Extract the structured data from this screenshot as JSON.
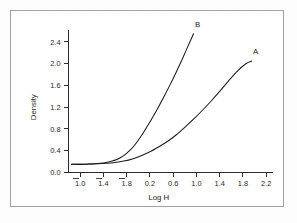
{
  "figure": {
    "background_color": "#ffffff",
    "frame_color": "#9aa3ad",
    "axis_color": "#2c2c2c",
    "curve_color": "#1b1b1b"
  },
  "chart_data": {
    "type": "line",
    "title": "",
    "subtitle": "",
    "xlabel": "Log H",
    "ylabel": "Density",
    "xlim": [
      -1.2,
      2.3
    ],
    "ylim": [
      0.0,
      2.62
    ],
    "grid": false,
    "legend_position": "inline-curve-labels",
    "xticks": [
      -1.0,
      -1.4,
      -1.8,
      0.2,
      0.6,
      1.0,
      1.4,
      1.8,
      2.2
    ],
    "xtick_labels": [
      "1.0",
      "1.4",
      "1.8",
      "0.2",
      "0.6",
      "1.0",
      "1.4",
      "1.8",
      "2.2"
    ],
    "xtick_overbar": [
      true,
      true,
      true,
      false,
      false,
      false,
      false,
      false,
      false
    ],
    "xtick_positions": [
      -1.0,
      -0.6,
      -0.2,
      0.2,
      0.6,
      1.0,
      1.4,
      1.8,
      2.2
    ],
    "yticks": [
      0.0,
      0.4,
      0.8,
      1.2,
      1.6,
      2.0,
      2.4
    ],
    "ytick_labels": [
      "0.0",
      "0.4",
      "0.8",
      "1.2",
      "1.6",
      "2.0",
      "2.4"
    ],
    "annotations": [
      {
        "text": "A",
        "x": 2.02,
        "y": 2.18
      },
      {
        "text": "B",
        "x": 1.02,
        "y": 2.68
      }
    ],
    "series": [
      {
        "name": "B",
        "label": "B",
        "x": [
          -1.15,
          -1.05,
          -0.95,
          -0.85,
          -0.75,
          -0.65,
          -0.55,
          -0.45,
          -0.35,
          -0.25,
          -0.15,
          -0.05,
          0.05,
          0.15,
          0.25,
          0.35,
          0.45,
          0.55,
          0.65,
          0.75,
          0.85,
          0.95
        ],
        "y": [
          0.15,
          0.15,
          0.15,
          0.155,
          0.16,
          0.17,
          0.185,
          0.21,
          0.25,
          0.31,
          0.4,
          0.52,
          0.67,
          0.84,
          1.02,
          1.21,
          1.41,
          1.62,
          1.84,
          2.07,
          2.31,
          2.55
        ]
      },
      {
        "name": "A",
        "label": "A",
        "x": [
          -1.15,
          -1.0,
          -0.85,
          -0.7,
          -0.55,
          -0.4,
          -0.25,
          -0.1,
          0.05,
          0.2,
          0.35,
          0.5,
          0.65,
          0.8,
          0.95,
          1.1,
          1.25,
          1.4,
          1.55,
          1.7,
          1.85,
          1.95
        ],
        "y": [
          0.15,
          0.15,
          0.155,
          0.16,
          0.17,
          0.185,
          0.21,
          0.25,
          0.31,
          0.38,
          0.47,
          0.57,
          0.69,
          0.83,
          0.98,
          1.14,
          1.31,
          1.49,
          1.68,
          1.86,
          2.0,
          2.05
        ]
      }
    ]
  }
}
